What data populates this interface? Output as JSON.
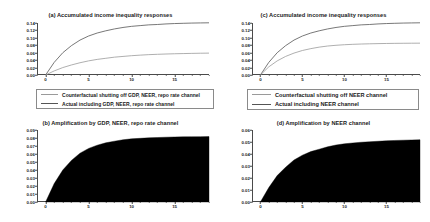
{
  "figure": {
    "background": "#ffffff",
    "line_color_actual": "#555555",
    "line_color_counterfactual": "#9a9a9a",
    "fill_color": "#000000",
    "axis_color": "#4a4a4a"
  },
  "panels": [
    {
      "key": "a",
      "title": "(a) Accumulated income inequality responses",
      "legend": {
        "counterfactual": "Counterfactual shutting off GDP, NEER, repo rate channel",
        "actual": "Actual including GDP, NEER, repo rate channel"
      }
    },
    {
      "key": "b",
      "title": "(b) Amplification by GDP, NEER, repo rate channel"
    },
    {
      "key": "c",
      "title": "(c) Accumulated income inequality responses",
      "legend": {
        "counterfactual": "Counterfactual shutting off NEER channel",
        "actual": "Actual including NEER channel"
      }
    },
    {
      "key": "d",
      "title": "(d) Amplification by NEER channel"
    }
  ],
  "chart_data": [
    {
      "type": "line",
      "panel": "a",
      "title": "(a) Accumulated income inequality responses",
      "xlabel": "",
      "ylabel": "",
      "xlim": [
        -1,
        19
      ],
      "ylim": [
        0.0,
        0.14
      ],
      "xticks": [
        0,
        5,
        10,
        15
      ],
      "yticks": [
        0.0,
        0.02,
        0.04,
        0.06,
        0.08,
        0.1,
        0.12,
        0.14
      ],
      "ytick_labels": [
        "0.00",
        "0.02",
        "0.04",
        "0.06",
        "0.08",
        "0.10",
        "0.12",
        "0.14"
      ],
      "grid": false,
      "legend_position": "below",
      "x": [
        0,
        1,
        2,
        3,
        4,
        5,
        6,
        7,
        8,
        9,
        10,
        11,
        12,
        13,
        14,
        15,
        16,
        17,
        18,
        19
      ],
      "series": [
        {
          "name": "Actual including GDP, NEER, repo rate channel",
          "color": "#555555",
          "values": [
            0.0,
            0.034,
            0.06,
            0.079,
            0.094,
            0.105,
            0.113,
            0.119,
            0.124,
            0.128,
            0.131,
            0.133,
            0.135,
            0.136,
            0.1375,
            0.1385,
            0.1392,
            0.1398,
            0.1402,
            0.1405
          ]
        },
        {
          "name": "Counterfactual shutting off GDP, NEER, repo rate channel",
          "color": "#9a9a9a",
          "values": [
            0.0,
            0.011,
            0.02,
            0.027,
            0.033,
            0.038,
            0.042,
            0.045,
            0.048,
            0.05,
            0.052,
            0.0535,
            0.0548,
            0.0557,
            0.0565,
            0.0572,
            0.0577,
            0.0582,
            0.0586,
            0.0589
          ]
        }
      ]
    },
    {
      "type": "area",
      "panel": "b",
      "title": "(b) Amplification by GDP, NEER, repo rate channel",
      "xlabel": "",
      "ylabel": "",
      "xlim": [
        -1,
        19
      ],
      "ylim": [
        0.0,
        0.09
      ],
      "xticks": [
        0,
        5,
        10,
        15
      ],
      "yticks": [
        0.0,
        0.01,
        0.02,
        0.03,
        0.04,
        0.05,
        0.06,
        0.07,
        0.08,
        0.09
      ],
      "ytick_labels": [
        "0.00",
        "0.01",
        "0.02",
        "0.03",
        "0.04",
        "0.05",
        "0.06",
        "0.07",
        "0.08",
        "0.09"
      ],
      "grid": false,
      "fill": "#000000",
      "x": [
        0,
        1,
        2,
        3,
        4,
        5,
        6,
        7,
        8,
        9,
        10,
        11,
        12,
        13,
        14,
        15,
        16,
        17,
        18,
        19
      ],
      "values": [
        0.0,
        0.023,
        0.04,
        0.052,
        0.061,
        0.067,
        0.071,
        0.074,
        0.076,
        0.0778,
        0.079,
        0.0796,
        0.0802,
        0.0806,
        0.081,
        0.0813,
        0.0815,
        0.0816,
        0.0817,
        0.0818
      ]
    },
    {
      "type": "line",
      "panel": "c",
      "title": "(c) Accumulated income inequality responses",
      "xlabel": "",
      "ylabel": "",
      "xlim": [
        -1,
        19
      ],
      "ylim": [
        0.0,
        0.14
      ],
      "xticks": [
        0,
        5,
        10,
        15
      ],
      "yticks": [
        0.0,
        0.02,
        0.04,
        0.06,
        0.08,
        0.1,
        0.12,
        0.14
      ],
      "ytick_labels": [
        "0.00",
        "0.02",
        "0.04",
        "0.06",
        "0.08",
        "0.10",
        "0.12",
        "0.14"
      ],
      "grid": false,
      "legend_position": "below",
      "x": [
        0,
        1,
        2,
        3,
        4,
        5,
        6,
        7,
        8,
        9,
        10,
        11,
        12,
        13,
        14,
        15,
        16,
        17,
        18,
        19
      ],
      "series": [
        {
          "name": "Actual including NEER channel",
          "color": "#555555",
          "values": [
            0.0,
            0.034,
            0.06,
            0.079,
            0.094,
            0.105,
            0.113,
            0.119,
            0.124,
            0.128,
            0.131,
            0.133,
            0.135,
            0.136,
            0.1375,
            0.1385,
            0.1392,
            0.1398,
            0.1402,
            0.1405
          ]
        },
        {
          "name": "Counterfactual shutting off NEER channel",
          "color": "#9a9a9a",
          "values": [
            0.0,
            0.022,
            0.038,
            0.05,
            0.059,
            0.066,
            0.071,
            0.075,
            0.078,
            0.08,
            0.0815,
            0.0826,
            0.0834,
            0.084,
            0.0845,
            0.0849,
            0.0852,
            0.0854,
            0.0856,
            0.0857
          ]
        }
      ]
    },
    {
      "type": "area",
      "panel": "d",
      "title": "(d) Amplification by NEER channel",
      "xlabel": "",
      "ylabel": "",
      "xlim": [
        -1,
        19
      ],
      "ylim": [
        0.0,
        0.06
      ],
      "xticks": [
        0,
        5,
        10,
        15
      ],
      "yticks": [
        0.0,
        0.01,
        0.02,
        0.03,
        0.04,
        0.05,
        0.06
      ],
      "ytick_labels": [
        "0.00",
        "0.01",
        "0.02",
        "0.03",
        "0.04",
        "0.05",
        "0.06"
      ],
      "grid": false,
      "fill": "#000000",
      "x": [
        0,
        1,
        2,
        3,
        4,
        5,
        6,
        7,
        8,
        9,
        10,
        11,
        12,
        13,
        14,
        15,
        16,
        17,
        18,
        19
      ],
      "values": [
        0.0,
        0.012,
        0.022,
        0.029,
        0.035,
        0.039,
        0.042,
        0.044,
        0.046,
        0.0475,
        0.0485,
        0.0492,
        0.0498,
        0.0502,
        0.0506,
        0.051,
        0.0513,
        0.0515,
        0.0517,
        0.0519
      ]
    }
  ]
}
